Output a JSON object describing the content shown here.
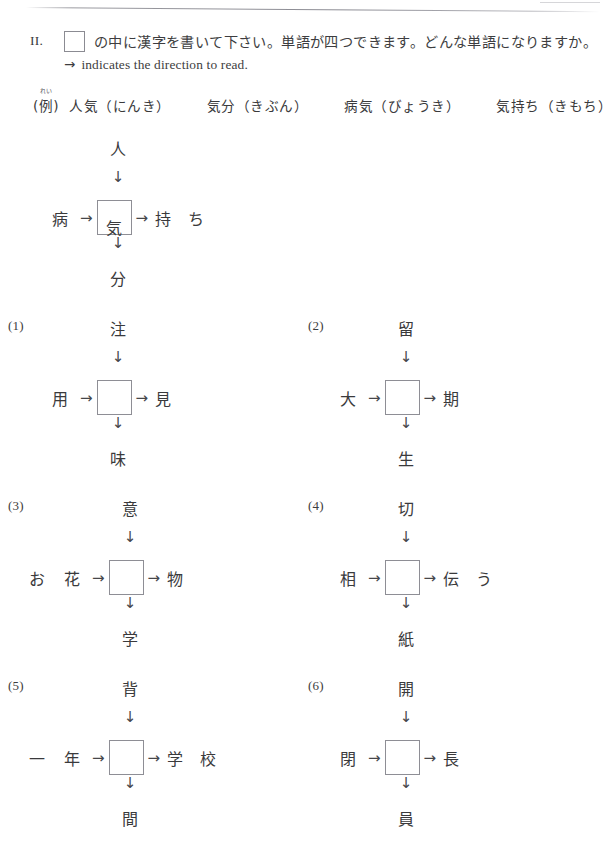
{
  "header": {
    "roman_numeral": "II.",
    "instruction": "の中に漢字を書いて下さい。単語が四つできます。どんな単語になりますか。",
    "subline_arrow": "→",
    "subline": "indicates the direction to read.",
    "box_icon": "empty-answer-box-icon"
  },
  "example_row": {
    "label": "(例)",
    "label_ruby": "れい",
    "words": [
      "人気（にんき）",
      "気分（きぶん）",
      "病気（びょうき）",
      "気持ち（きもち）"
    ]
  },
  "arrows": {
    "down": "↓",
    "right": "→"
  },
  "puzzles": [
    {
      "label": "",
      "top": "人",
      "left": "病",
      "center": "気",
      "right": "持 ち",
      "bottom": "分",
      "is_example": true
    },
    {
      "label": "(1)",
      "top": "注",
      "left": "用",
      "center": "",
      "right": "見",
      "bottom": "味",
      "is_example": false
    },
    {
      "label": "(2)",
      "top": "留",
      "left": "大",
      "center": "",
      "right": "期",
      "bottom": "生",
      "is_example": false
    },
    {
      "label": "(3)",
      "top": "意",
      "left": "お 花",
      "center": "",
      "right": "物",
      "bottom": "学",
      "is_example": false
    },
    {
      "label": "(4)",
      "top": "切",
      "left": "相",
      "center": "",
      "right": "伝 う",
      "bottom": "紙",
      "is_example": false
    },
    {
      "label": "(5)",
      "top": "背",
      "left": "一 年",
      "center": "",
      "right": "学 校",
      "bottom": "間",
      "is_example": false
    },
    {
      "label": "(6)",
      "top": "開",
      "left": "閉",
      "center": "",
      "right": "長",
      "bottom": "員",
      "is_example": false
    }
  ],
  "colors": {
    "ink": "#3a3a3c",
    "box_border": "#8e8e95",
    "page": "#ffffff"
  }
}
